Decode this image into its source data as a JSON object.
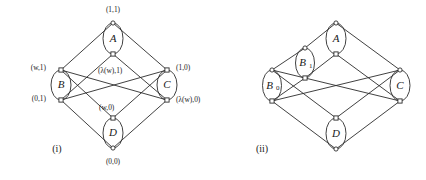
{
  "figure": {
    "background_color": "#ffffff",
    "ink_color": "#2b2b2b",
    "width": 426,
    "height": 180
  },
  "diagrams": [
    {
      "id": "diagram-i",
      "caption": "(i)",
      "caption_x": 57,
      "caption_y": 152,
      "description": "Hasse diagram of a lattice drawn as a cube with four lens-shaped node pairs A, B, C, D",
      "vertices": [
        {
          "name": "top",
          "x": 113,
          "y": 23,
          "shape": "circle"
        },
        {
          "name": "a-lower",
          "x": 113,
          "y": 54,
          "shape": "square"
        },
        {
          "name": "b-upper",
          "x": 61,
          "y": 70,
          "shape": "square"
        },
        {
          "name": "b-lower",
          "x": 61,
          "y": 100,
          "shape": "square"
        },
        {
          "name": "c-upper",
          "x": 167,
          "y": 70,
          "shape": "square"
        },
        {
          "name": "c-lower",
          "x": 167,
          "y": 100,
          "shape": "square"
        },
        {
          "name": "d-upper",
          "x": 113,
          "y": 118,
          "shape": "square"
        },
        {
          "name": "bottom",
          "x": 113,
          "y": 148,
          "shape": "circle"
        }
      ],
      "lenses": [
        {
          "label": "A",
          "sub": "",
          "cx": 113,
          "cy": 38.5,
          "rx": 10,
          "ry": 15.5
        },
        {
          "label": "B",
          "sub": "",
          "cx": 61,
          "cy": 85,
          "rx": 10,
          "ry": 15
        },
        {
          "label": "C",
          "sub": "",
          "cx": 167,
          "cy": 85,
          "rx": 10,
          "ry": 15
        },
        {
          "label": "D",
          "sub": "",
          "cx": 113,
          "cy": 133,
          "rx": 10,
          "ry": 15
        }
      ],
      "edges": [
        {
          "from": "top",
          "to": "b-upper"
        },
        {
          "from": "top",
          "to": "c-upper"
        },
        {
          "from": "a-lower",
          "to": "b-lower"
        },
        {
          "from": "a-lower",
          "to": "c-lower"
        },
        {
          "from": "b-upper",
          "to": "d-upper"
        },
        {
          "from": "b-upper",
          "to": "c-lower"
        },
        {
          "from": "c-upper",
          "to": "d-upper"
        },
        {
          "from": "c-upper",
          "to": "b-lower"
        },
        {
          "from": "b-lower",
          "to": "bottom"
        },
        {
          "from": "c-lower",
          "to": "bottom"
        }
      ],
      "coord_labels": [
        {
          "text": "(1,1)",
          "x": 113,
          "y": 12,
          "anchor": "middle",
          "for": "top"
        },
        {
          "text": "(w,1)",
          "x": 46,
          "y": 70,
          "anchor": "end",
          "for": "b-upper"
        },
        {
          "text": "(0,1)",
          "x": 46,
          "y": 101,
          "anchor": "end",
          "for": "b-lower"
        },
        {
          "text": "(λ(w),1)",
          "x": 98,
          "y": 73,
          "anchor": "start",
          "for": "a-lower"
        },
        {
          "text": "(w,0)",
          "x": 99,
          "y": 110,
          "anchor": "start",
          "for": "d-upper"
        },
        {
          "text": "(1,0)",
          "x": 176,
          "y": 70,
          "anchor": "start",
          "for": "c-upper"
        },
        {
          "text": "(λ(w),0)",
          "x": 176,
          "y": 102,
          "anchor": "start",
          "for": "c-lower"
        },
        {
          "text": "(0,0)",
          "x": 113,
          "y": 164,
          "anchor": "middle",
          "for": "bottom"
        }
      ]
    },
    {
      "id": "diagram-ii",
      "caption": "(ii)",
      "caption_x": 262,
      "caption_y": 152,
      "description": "Hasse diagram of a lattice drawn as a cube with five lens-shaped node pairs A, B1, B0, C, D",
      "vertices": [
        {
          "name": "top",
          "x": 336,
          "y": 23,
          "shape": "circle"
        },
        {
          "name": "a-lower",
          "x": 336,
          "y": 54,
          "shape": "square"
        },
        {
          "name": "b1-upper",
          "x": 305,
          "y": 48,
          "shape": "circle"
        },
        {
          "name": "b1-lower",
          "x": 305,
          "y": 78,
          "shape": "square"
        },
        {
          "name": "b0-upper",
          "x": 272,
          "y": 70,
          "shape": "circle"
        },
        {
          "name": "b0-lower",
          "x": 272,
          "y": 101,
          "shape": "square"
        },
        {
          "name": "c-upper",
          "x": 400,
          "y": 70,
          "shape": "circle"
        },
        {
          "name": "c-lower",
          "x": 400,
          "y": 101,
          "shape": "square"
        },
        {
          "name": "d-upper",
          "x": 336,
          "y": 118,
          "shape": "square"
        },
        {
          "name": "bottom",
          "x": 336,
          "y": 149,
          "shape": "circle"
        }
      ],
      "lenses": [
        {
          "label": "A",
          "sub": "",
          "cx": 336,
          "cy": 38.5,
          "rx": 10,
          "ry": 15.5
        },
        {
          "label": "B",
          "sub": "1",
          "cx": 305,
          "cy": 63,
          "rx": 9.5,
          "ry": 15
        },
        {
          "label": "B",
          "sub": "0",
          "cx": 272,
          "cy": 85.5,
          "rx": 9.5,
          "ry": 15.5
        },
        {
          "label": "C",
          "sub": "",
          "cx": 400,
          "cy": 85.5,
          "rx": 10,
          "ry": 15.5
        },
        {
          "label": "D",
          "sub": "",
          "cx": 336,
          "cy": 133.5,
          "rx": 10,
          "ry": 15.5
        }
      ],
      "edges": [
        {
          "from": "top",
          "to": "b1-upper"
        },
        {
          "from": "top",
          "to": "c-upper"
        },
        {
          "from": "a-lower",
          "to": "b1-lower"
        },
        {
          "from": "a-lower",
          "to": "c-lower"
        },
        {
          "from": "b1-upper",
          "to": "b0-upper"
        },
        {
          "from": "b1-lower",
          "to": "b0-lower"
        },
        {
          "from": "b0-upper",
          "to": "d-upper"
        },
        {
          "from": "b0-upper",
          "to": "b1-lower"
        },
        {
          "from": "b1-lower",
          "to": "c-lower"
        },
        {
          "from": "c-upper",
          "to": "d-upper"
        },
        {
          "from": "c-upper",
          "to": "b0-lower"
        },
        {
          "from": "b0-lower",
          "to": "bottom"
        },
        {
          "from": "c-lower",
          "to": "bottom"
        }
      ],
      "coord_labels": []
    }
  ]
}
